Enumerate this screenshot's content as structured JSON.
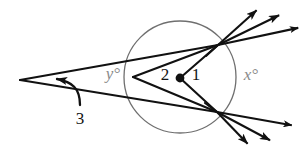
{
  "figure": {
    "background_color": "#ffffff",
    "width": 303,
    "height": 147
  },
  "style": {
    "line_color": "#111111",
    "circle_color": "#6f6f6f",
    "gray_label_color": "#8a8a8a",
    "black_label_color": "#141414",
    "line_width": 2.1,
    "circle_width": 1.3
  },
  "circle": {
    "name": "main-circle",
    "cx": 180,
    "cy": 77,
    "r": 56
  },
  "points": {
    "exterior_apex": {
      "x": 20,
      "y": 80
    },
    "circle_left_vertex": {
      "x": 133,
      "y": 77
    },
    "upper_right_intersection": {
      "x": 218,
      "y": 45
    },
    "lower_right_intersection": {
      "x": 217,
      "y": 112
    },
    "center_dot": {
      "x": 180,
      "y": 78
    }
  },
  "labels": {
    "angle_y": {
      "text": "y°",
      "x": 113,
      "y": 79,
      "color": "#8a8a8a",
      "style": "italic",
      "size": 17
    },
    "angle_x": {
      "text": "x°",
      "x": 251,
      "y": 80,
      "color": "#8a8a8a",
      "style": "italic",
      "size": 17
    },
    "angle_2": {
      "text": "2",
      "x": 165,
      "y": 80,
      "color": "#141414",
      "style": "normal",
      "size": 17
    },
    "angle_1": {
      "text": "1",
      "x": 196,
      "y": 80,
      "color": "#141414",
      "style": "normal",
      "size": 17
    },
    "angle_3": {
      "text": "3",
      "x": 80,
      "y": 118,
      "color": "#141414",
      "style": "normal",
      "size": 17
    }
  },
  "rays": {
    "upper_right_arrows": [
      {
        "name": "ray-upper-1",
        "angle_deg": -42,
        "length": 52
      },
      {
        "name": "ray-upper-2",
        "angle_deg": -26,
        "length": 68
      },
      {
        "name": "ray-upper-3",
        "angle_deg": -12,
        "length": 82
      }
    ],
    "lower_right_arrows": [
      {
        "name": "ray-lower-1",
        "angle_deg": 46,
        "length": 44
      },
      {
        "name": "ray-lower-2",
        "angle_deg": 28,
        "length": 60
      },
      {
        "name": "ray-lower-3",
        "angle_deg": 10,
        "length": 76
      }
    ]
  },
  "chords": [
    {
      "name": "chord-left-to-upper",
      "from": "circle_left_vertex",
      "to": "upper_right_intersection"
    },
    {
      "name": "chord-left-to-lower",
      "from": "circle_left_vertex",
      "to": "lower_right_intersection"
    },
    {
      "name": "radius-center-to-upper",
      "from": "center_dot",
      "to": "upper_right_intersection"
    },
    {
      "name": "radius-center-to-lower",
      "from": "center_dot",
      "to": "lower_right_intersection"
    },
    {
      "name": "secant-apex-to-upper",
      "from": "exterior_apex",
      "to": "upper_right_intersection"
    },
    {
      "name": "secant-apex-to-lower",
      "from": "exterior_apex",
      "to": "lower_right_intersection"
    }
  ],
  "angle_arc": {
    "name": "angle-3-arc-arrow",
    "description": "curved arrow marking the exterior angle at the apex"
  }
}
